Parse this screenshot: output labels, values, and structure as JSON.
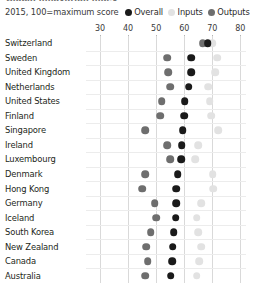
{
  "header": {
    "title_sliver": "Global innovation index",
    "subtitle": "2015, 100=maximum score"
  },
  "legend": {
    "position": "top-right",
    "items": [
      {
        "label": "Overall",
        "color": "#1a1a1a",
        "key": "overall"
      },
      {
        "label": "Inputs",
        "color": "#e2e2e2",
        "key": "inputs"
      },
      {
        "label": "Outputs",
        "color": "#6e6e6e",
        "key": "outputs"
      }
    ]
  },
  "colors": {
    "overall": "#1a1a1a",
    "inputs": "#e2e2e2",
    "outputs": "#6e6e6e",
    "gridline": "#d9d9d9",
    "rowline": "#ececec",
    "text": "#231f20"
  },
  "chart_data": {
    "type": "scatter",
    "title": "Global innovation index",
    "subtitle": "2015, 100=maximum score",
    "xlabel": "",
    "ylabel": "",
    "xlim": [
      25,
      82
    ],
    "xticks": [
      30,
      40,
      50,
      60,
      70,
      80
    ],
    "grid": true,
    "orientation": "horizontal",
    "legend_position": "top-right",
    "categories": [
      "Switzerland",
      "Sweden",
      "United Kingdom",
      "Netherlands",
      "United States",
      "Finland",
      "Singapore",
      "Ireland",
      "Luxembourg",
      "Denmark",
      "Hong Kong",
      "Germany",
      "Iceland",
      "South Korea",
      "New Zealand",
      "Canada",
      "Australia"
    ],
    "series": [
      {
        "name": "Overall",
        "key": "overall",
        "color": "#1a1a1a",
        "values": [
          68.3,
          62.4,
          62.4,
          61.6,
          60.1,
          60.0,
          59.4,
          59.1,
          59.0,
          57.7,
          57.2,
          57.1,
          57.0,
          56.3,
          55.9,
          55.7,
          55.2
        ]
      },
      {
        "name": "Inputs",
        "key": "inputs",
        "color": "#e2e2e2",
        "values": [
          70.0,
          71.8,
          71.0,
          68.6,
          69.0,
          69.5,
          72.0,
          65.0,
          64.0,
          70.1,
          70.4,
          66.0,
          64.5,
          65.0,
          66.0,
          65.4,
          64.4
        ]
      },
      {
        "name": "Outputs",
        "key": "outputs",
        "color": "#6e6e6e",
        "values": [
          66.6,
          54.0,
          54.2,
          55.0,
          52.0,
          51.5,
          46.0,
          54.0,
          55.0,
          46.0,
          45.0,
          49.5,
          50.0,
          48.0,
          46.5,
          47.0,
          46.0
        ]
      }
    ]
  }
}
